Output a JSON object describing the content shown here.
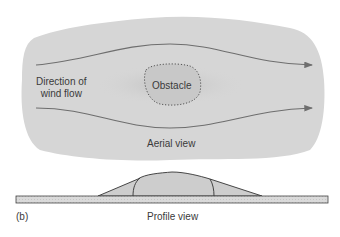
{
  "figure": {
    "panel_label": "(b)",
    "aerial": {
      "caption": "Aerial view",
      "wind_label_line1": "Direction of",
      "wind_label_line2": "wind flow",
      "obstacle_label": "Obstacle"
    },
    "profile": {
      "caption": "Profile view"
    },
    "colors": {
      "blob": "#d6d6d6",
      "stipple": "#c2c2c2",
      "arrow": "#6e6e6e",
      "outline": "#333333",
      "ground": "#d9d9d9",
      "mound": "#cfcfcf"
    }
  }
}
